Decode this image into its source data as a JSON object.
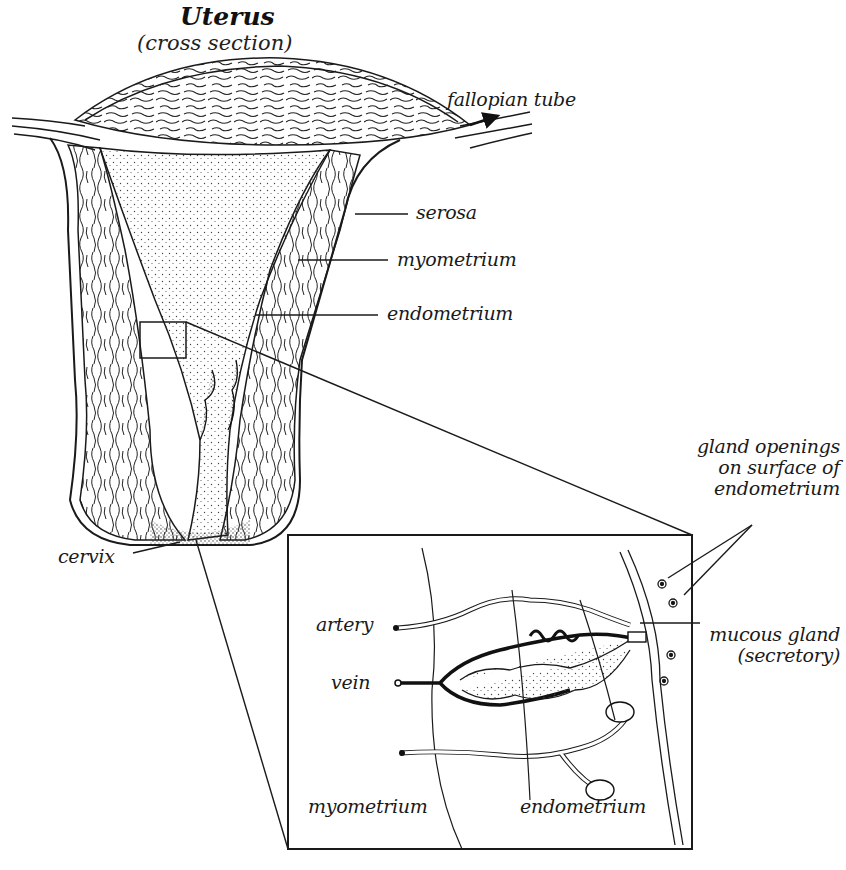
{
  "title": "Uterus",
  "subtitle": "(cross section)",
  "labels": {
    "fallopian_tube": "fallopian tube",
    "serosa": "serosa",
    "myometrium": "myometrium",
    "endometrium": "endometrium",
    "cervix": "cervix"
  },
  "inset": {
    "gland_openings": [
      "gland openings",
      "on surface of",
      "endometrium"
    ],
    "artery": "artery",
    "vein": "vein",
    "mucous_gland": [
      "mucous gland",
      "(secretory)"
    ],
    "myometrium": "myometrium",
    "endometrium": "endometrium"
  },
  "colors": {
    "ink": "#1a1a1a",
    "stipple": "#555555",
    "background": "#ffffff"
  }
}
